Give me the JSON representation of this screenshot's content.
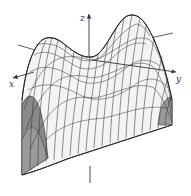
{
  "figure": {
    "type": "3d-wireframe-surface",
    "axes": {
      "x_label": "x",
      "y_label": "y",
      "z_label": "z"
    },
    "colors": {
      "background": "#ffffff",
      "mesh_line": "#333333",
      "axis_line": "#333333",
      "shaded_face": "#8a8a8a"
    }
  }
}
